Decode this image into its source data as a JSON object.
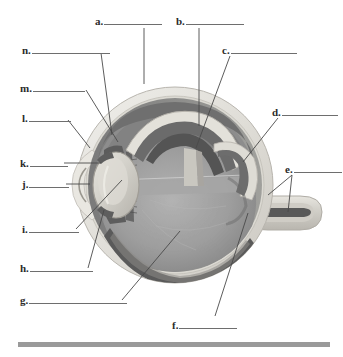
{
  "figure": {
    "type": "anatomical-illustration",
    "width": 343,
    "height": 357,
    "background_color": "#ffffff"
  },
  "labels": [
    {
      "id": "a",
      "letter": "a.",
      "text_x": 95,
      "text_y": 15,
      "blank_width": 58,
      "leader": {
        "x1": 144,
        "y1": 28,
        "x2": 144,
        "y2": 84
      }
    },
    {
      "id": "b",
      "letter": "b.",
      "text_x": 176,
      "text_y": 15,
      "blank_width": 58,
      "leader": {
        "x1": 199,
        "y1": 28,
        "x2": 199,
        "y2": 126
      }
    },
    {
      "id": "c",
      "letter": "c.",
      "text_x": 222,
      "text_y": 44,
      "blank_width": 66,
      "leader": {
        "x1": 230,
        "y1": 56,
        "x2": 196,
        "y2": 148
      }
    },
    {
      "id": "d",
      "letter": "d.",
      "text_x": 272,
      "text_y": 106,
      "blank_width": 56,
      "leader": {
        "x1": 278,
        "y1": 118,
        "x2": 243,
        "y2": 162
      }
    },
    {
      "id": "e",
      "letter": "e.",
      "text_x": 285,
      "text_y": 163,
      "blank_width": 48,
      "leader": {
        "x1": 292,
        "y1": 175,
        "x2": 268,
        "y2": 195
      }
    },
    {
      "id": "e2",
      "letter": "",
      "text_x": 0,
      "text_y": 0,
      "blank_width": 0,
      "leader": {
        "x1": 292,
        "y1": 175,
        "x2": 288,
        "y2": 212
      }
    },
    {
      "id": "f",
      "letter": "f.",
      "text_x": 172,
      "text_y": 319,
      "blank_width": 58,
      "leader": {
        "x1": 215,
        "y1": 316,
        "x2": 248,
        "y2": 213
      }
    },
    {
      "id": "g",
      "letter": "g.",
      "text_x": 20,
      "text_y": 294,
      "blank_width": 98,
      "leader": {
        "x1": 122,
        "y1": 300,
        "x2": 180,
        "y2": 231
      }
    },
    {
      "id": "h",
      "letter": "h.",
      "text_x": 20,
      "text_y": 262,
      "blank_width": 63,
      "leader": {
        "x1": 88,
        "y1": 268,
        "x2": 104,
        "y2": 210
      }
    },
    {
      "id": "i",
      "letter": "i.",
      "text_x": 22,
      "text_y": 223,
      "blank_width": 50,
      "leader": {
        "x1": 76,
        "y1": 229,
        "x2": 122,
        "y2": 180
      }
    },
    {
      "id": "j",
      "letter": "j.",
      "text_x": 22,
      "text_y": 178,
      "blank_width": 40,
      "leader": {
        "x1": 66,
        "y1": 184,
        "x2": 90,
        "y2": 184
      }
    },
    {
      "id": "k",
      "letter": "k.",
      "text_x": 20,
      "text_y": 157,
      "blank_width": 38,
      "leader": {
        "x1": 64,
        "y1": 163,
        "x2": 101,
        "y2": 163
      }
    },
    {
      "id": "l",
      "letter": "l.",
      "text_x": 22,
      "text_y": 112,
      "blank_width": 42,
      "leader": {
        "x1": 68,
        "y1": 120,
        "x2": 90,
        "y2": 148
      }
    },
    {
      "id": "m",
      "letter": "m.",
      "text_x": 20,
      "text_y": 82,
      "blank_width": 52,
      "leader": {
        "x1": 86,
        "y1": 90,
        "x2": 118,
        "y2": 142
      }
    },
    {
      "id": "n",
      "letter": "n.",
      "text_x": 22,
      "text_y": 44,
      "blank_width": 78,
      "leader": {
        "x1": 101,
        "y1": 53,
        "x2": 112,
        "y2": 135
      }
    }
  ],
  "bottom_bar": {
    "x": 18,
    "y": 342,
    "width": 312,
    "height": 5,
    "color": "#9a9a9a"
  },
  "palette": {
    "sclera_outer": "#e4e2dd",
    "sclera_mid": "#cfccc6",
    "choroid": "#8f8f8f",
    "retina": "#7d7d7d",
    "vitreous": "#9b9b9b",
    "vitreous_dark": "#848484",
    "lens": "#cfcdc6",
    "cornea": "#dcdad4",
    "iris_dark": "#5f5f5f",
    "optic_nerve": "#d6d4cd",
    "leader_line": "#4a4a4a",
    "blank_line": "#6e6e6e",
    "text": "#2b2b2b"
  }
}
